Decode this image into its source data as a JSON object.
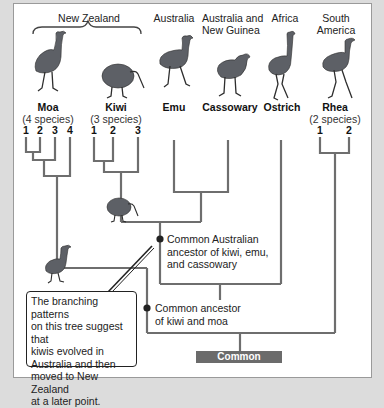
{
  "regions": {
    "new_zealand": "New Zealand",
    "australia": "Australia",
    "australia_new_guinea": [
      "Australia and",
      "New Guinea"
    ],
    "africa": "Africa",
    "south_america": [
      "South",
      "America"
    ]
  },
  "taxa": [
    {
      "name": "Moa",
      "species": "(4 species)",
      "numbers": [
        "1",
        "2",
        "3",
        "4"
      ],
      "region": "New Zealand"
    },
    {
      "name": "Kiwi",
      "species": "(3 species)",
      "numbers": [
        "1",
        "2",
        "3"
      ],
      "region": "New Zealand"
    },
    {
      "name": "Emu",
      "region": "Australia"
    },
    {
      "name": "Cassowary",
      "region": "Australia and New Guinea"
    },
    {
      "name": "Ostrich",
      "region": "Africa"
    },
    {
      "name": "Rhea",
      "species": "(2 species)",
      "numbers": [
        "1",
        "2"
      ],
      "region": "South America"
    }
  ],
  "nodes": {
    "australian_ancestor": [
      "Common Australian",
      "ancestor of kiwi, emu,",
      "and cassowary"
    ],
    "kiwi_moa_ancestor": [
      "Common ancestor",
      "of kiwi and moa"
    ],
    "root": "Common ancestor"
  },
  "callout": {
    "text": [
      "The branching patterns",
      "on this tree suggest that",
      "kiwis evolved in",
      "Australia and then",
      "moved to New Zealand",
      "at a later point."
    ]
  },
  "colors": {
    "line": "#6e6e6e",
    "root_box": "#6b6b6b",
    "node_dot": "#222222",
    "background": "#dcdcdc",
    "panel": "#ffffff"
  }
}
